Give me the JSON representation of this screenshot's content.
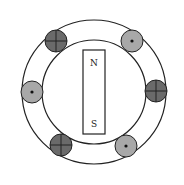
{
  "diagram": {
    "type": "generator-stator-rotor",
    "magnet": {
      "north_label": "N",
      "south_label": "S"
    },
    "conductors": [
      {
        "position": "top-left",
        "symbol": "cross",
        "meaning": "current into page",
        "color": "#6a6a6a"
      },
      {
        "position": "top-right",
        "symbol": "dot",
        "meaning": "current out of page",
        "color": "#a8a8a8"
      },
      {
        "position": "left",
        "symbol": "dot",
        "meaning": "current out of page",
        "color": "#a8a8a8"
      },
      {
        "position": "right",
        "symbol": "cross",
        "meaning": "current into page",
        "color": "#6a6a6a"
      },
      {
        "position": "bottom-left",
        "symbol": "cross",
        "meaning": "current into page",
        "color": "#6a6a6a"
      },
      {
        "position": "bottom-right",
        "symbol": "dot",
        "meaning": "current out of page",
        "color": "#a8a8a8"
      }
    ]
  }
}
